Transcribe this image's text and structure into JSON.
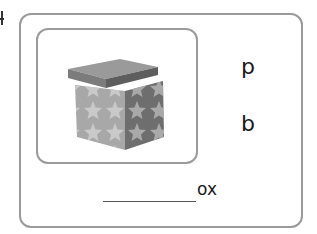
{
  "exercise": {
    "picture": {
      "icon": "star-gift-box-icon",
      "description": "open gift box with star pattern"
    },
    "letter_choices": [
      {
        "label": "p"
      },
      {
        "label": "b"
      }
    ],
    "word_prompt": {
      "blank": "__________",
      "ending": "ox"
    }
  },
  "colors": {
    "border": "#9a9a9a",
    "text": "#1a1a1a",
    "box_light": "#a8a8a8",
    "box_dark": "#6e6e6e",
    "star": "#cfcfcf"
  }
}
